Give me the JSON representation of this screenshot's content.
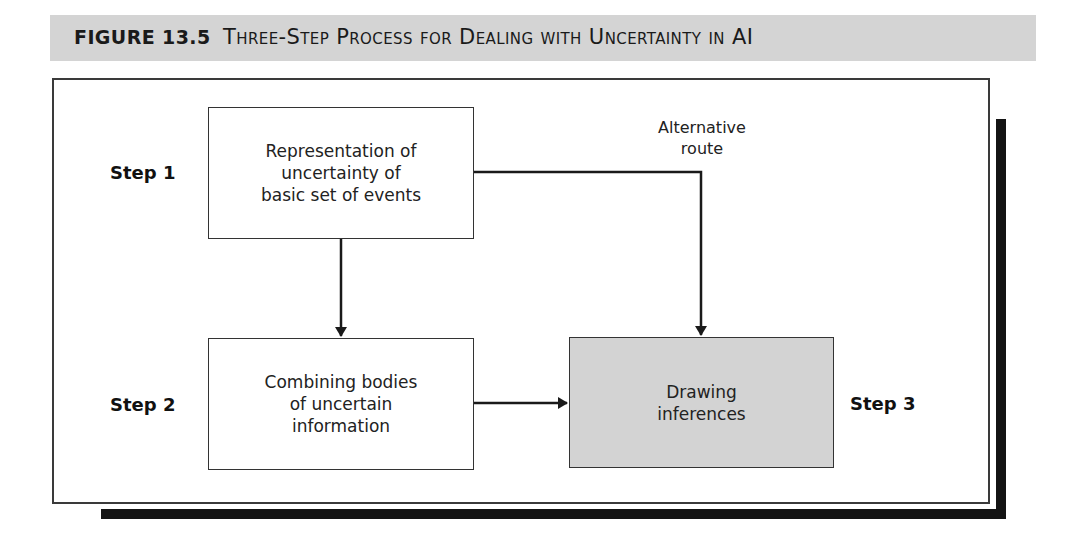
{
  "figure": {
    "number": "FIGURE 13.5",
    "title": "Three-Step Process for Dealing with Uncertainty in AI"
  },
  "steps": [
    {
      "label": "Step 1",
      "box_lines": [
        "Representation of",
        "uncertainty of",
        "basic set of events"
      ]
    },
    {
      "label": "Step 2",
      "box_lines": [
        "Combining bodies",
        "of uncertain",
        "information"
      ]
    },
    {
      "label": "Step 3",
      "box_lines": [
        "Drawing",
        "inferences"
      ]
    }
  ],
  "alternative_route": {
    "lines": [
      "Alternative",
      "route"
    ]
  },
  "colors": {
    "caption_bg": "#d4d4d4",
    "step3_fill": "#d3d3d3",
    "shadow": "#141414",
    "stroke": "#333333"
  }
}
